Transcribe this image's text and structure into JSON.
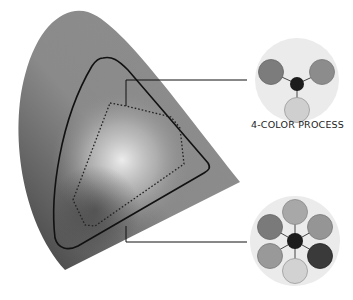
{
  "diagram": {
    "labels": {
      "four_color": "4-COLOR PROCESS"
    },
    "gamut": {
      "outer_fill_dark": "#505050",
      "outer_fill_mid": "#8a8a8a",
      "highlight": "#e6e6e6"
    },
    "four_color_disk": {
      "background": "#ebebeb",
      "dots": [
        {
          "name": "top-left",
          "color": "#7c7c7c"
        },
        {
          "name": "top-right",
          "color": "#8c8c8c"
        },
        {
          "name": "bottom",
          "color": "#cfcfcf"
        },
        {
          "name": "center",
          "color": "#1c1c1c"
        }
      ]
    },
    "six_color_disk": {
      "background": "#ebebeb",
      "dots": [
        {
          "name": "top",
          "color": "#a8a8a8"
        },
        {
          "name": "upper-left",
          "color": "#7a7a7a"
        },
        {
          "name": "upper-right",
          "color": "#959595"
        },
        {
          "name": "lower-left",
          "color": "#999999"
        },
        {
          "name": "lower-right",
          "color": "#3a3a3a"
        },
        {
          "name": "bottom",
          "color": "#d2d2d2"
        },
        {
          "name": "center",
          "color": "#1c1c1c"
        }
      ]
    }
  }
}
